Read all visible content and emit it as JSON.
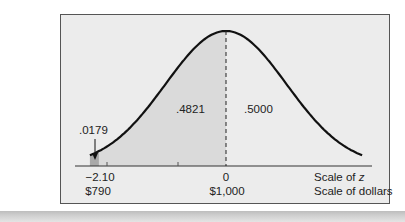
{
  "chart_data": {
    "type": "area",
    "title": "",
    "distribution": "normal",
    "mean_dollars": 1000,
    "curve": {
      "mu_z": 0,
      "sigma_z": 1,
      "z_range": [
        -2.25,
        2.25
      ]
    },
    "shaded_regions": [
      {
        "name": "left-tail",
        "z_from": -2.25,
        "z_to": -2.1,
        "area": ".0179",
        "color": "#a9a9a9"
      },
      {
        "name": "between",
        "z_from": -2.1,
        "z_to": 0,
        "area": ".4821",
        "color": "#dadada"
      }
    ],
    "area_labels": [
      {
        "text": ".0179",
        "region": "left-tail",
        "arrow": true
      },
      {
        "text": ".4821",
        "region": "between"
      },
      {
        "text": ".5000",
        "region": "right-half"
      }
    ],
    "mean_line": {
      "z": 0,
      "style": "dashed"
    },
    "x_axis": {
      "ticks_z": [
        {
          "z": -2.1,
          "label": "−2.10"
        },
        {
          "z": 0,
          "label": "0"
        }
      ],
      "ticks_dollars": [
        {
          "z": -2.1,
          "label": "$790"
        },
        {
          "z": 0,
          "label": "$1,000"
        }
      ],
      "scale_labels": {
        "z": "Scale of",
        "z_var": "z",
        "dollars": "Scale of dollars"
      }
    },
    "colors": {
      "panel_bg": "#ececec",
      "frame": "#555555",
      "curve": "#111111"
    }
  },
  "labels": {
    "tail_area": ".0179",
    "mid_area": ".4821",
    "right_area": ".5000",
    "z_tick_left": "−2.10",
    "z_tick_center": "0",
    "dollar_tick_left": "$790",
    "dollar_tick_center": "$1,000",
    "scale_z_prefix": "Scale of",
    "scale_z_var": "z",
    "scale_dollars": "Scale of dollars"
  }
}
